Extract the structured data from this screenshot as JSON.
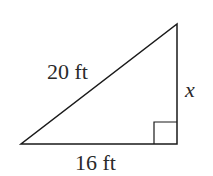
{
  "diagram": {
    "type": "right-triangle",
    "hypotenuse_label": "20 ft",
    "base_label": "16 ft",
    "vertical_side_label": "x",
    "right_angle_marker": true,
    "stroke_color": "#1a1a1a",
    "text_color": "#2a2a2a"
  }
}
